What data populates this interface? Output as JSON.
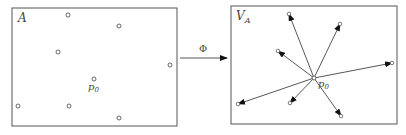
{
  "diagram": {
    "left_panel": {
      "label": "A",
      "center_label": "p",
      "center_sub": "0",
      "center": [
        94,
        79
      ],
      "points": [
        [
          68,
          15
        ],
        [
          119,
          26
        ],
        [
          58,
          52
        ],
        [
          170,
          65
        ],
        [
          18,
          106
        ],
        [
          69,
          106
        ],
        [
          119,
          118
        ]
      ]
    },
    "mapping": {
      "label": "Φ"
    },
    "right_panel": {
      "label": "V",
      "label_sub": "A",
      "center_label": "p",
      "center_sub": "0",
      "center": [
        314,
        78
      ],
      "vectors": [
        [
          289,
          14
        ],
        [
          340,
          24
        ],
        [
          278,
          51
        ],
        [
          392,
          63
        ],
        [
          238,
          104
        ],
        [
          290,
          103
        ],
        [
          341,
          116
        ]
      ]
    },
    "colors": {
      "border": "#555555",
      "line": "#444444",
      "arrow": "#111111"
    }
  }
}
